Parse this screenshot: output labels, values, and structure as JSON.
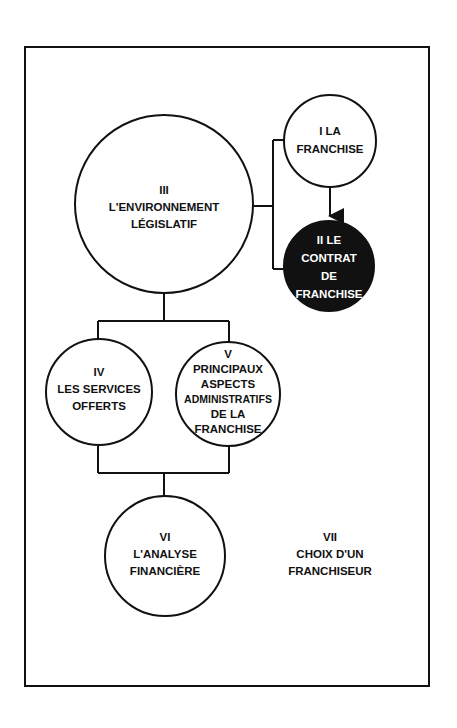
{
  "diagram": {
    "colors": {
      "stroke": "#111111",
      "background": "#ffffff",
      "filled_node": "#111111"
    },
    "nodes": [
      {
        "id": "I",
        "lines": [
          "I  LA",
          "FRANCHISE"
        ],
        "filled": false
      },
      {
        "id": "II",
        "lines": [
          "II  LE",
          "CONTRAT",
          "DE",
          "FRANCHISE"
        ],
        "filled": true
      },
      {
        "id": "III",
        "lines": [
          "III",
          "L'ENVIRONNEMENT",
          "LÉGISLATIF"
        ],
        "filled": false
      },
      {
        "id": "IV",
        "lines": [
          "IV",
          "LES SERVICES",
          "OFFERTS"
        ],
        "filled": false
      },
      {
        "id": "V",
        "lines": [
          "V",
          "PRINCIPAUX",
          "ASPECTS",
          "ADMINISTRATIFS",
          "DE  LA",
          "FRANCHISE"
        ],
        "filled": false
      },
      {
        "id": "VI",
        "lines": [
          "VI",
          "L'ANALYSE",
          "FINANCIÈRE"
        ],
        "filled": false
      },
      {
        "id": "VII",
        "lines": [
          "VII",
          "CHOIX  D'UN",
          "FRANCHISEUR"
        ],
        "filled": false,
        "no_circle": true
      }
    ],
    "edges": [
      {
        "from": "III",
        "to": "I",
        "type": "bracket"
      },
      {
        "from": "III",
        "to": "II",
        "type": "bracket"
      },
      {
        "from": "I",
        "to": "II",
        "type": "arrow"
      },
      {
        "from": "III",
        "to": "IV",
        "type": "tree"
      },
      {
        "from": "III",
        "to": "V",
        "type": "tree"
      },
      {
        "from": "IV",
        "to": "VI",
        "type": "tree"
      },
      {
        "from": "V",
        "to": "VI",
        "type": "tree"
      }
    ]
  }
}
